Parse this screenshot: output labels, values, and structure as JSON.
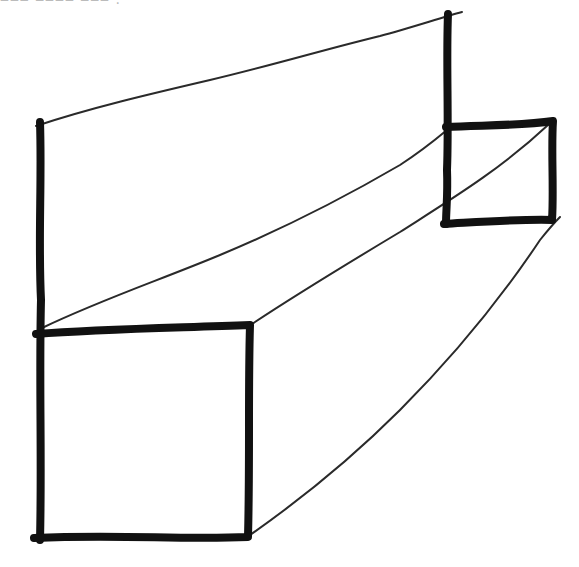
{
  "header": {
    "cropped_text": "‒‒‒ ‒‒‒‒ ‒‒‒ ."
  },
  "drawing": {
    "description": "hand-drawn pencil sketch of a rectangular beam/prism in perspective",
    "ink_color": "#111111",
    "paper_color": "#ffffff",
    "front_square": {
      "tl": [
        40,
        330
      ],
      "tr": [
        250,
        325
      ],
      "br": [
        248,
        537
      ],
      "bl": [
        40,
        537
      ]
    },
    "back_square": {
      "tl": [
        447,
        127
      ],
      "tr": [
        553,
        122
      ],
      "br": [
        552,
        220
      ],
      "bl": [
        445,
        223
      ]
    },
    "back_wall_top": {
      "left": [
        40,
        125
      ],
      "right": [
        460,
        12
      ]
    }
  }
}
